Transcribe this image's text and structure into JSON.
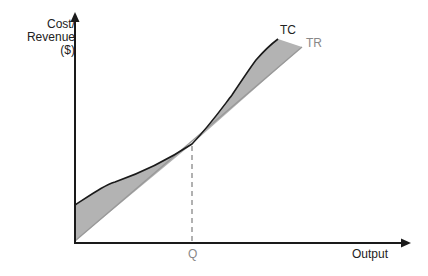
{
  "diagram": {
    "y_axis_label_lines": [
      "Cost/",
      "Revenue",
      "($)"
    ],
    "x_axis_label": "Output",
    "curves": {
      "tc_label": "TC",
      "tr_label": "TR"
    },
    "marker_label": "Q",
    "colors": {
      "axis": "#1a1a1a",
      "tc": "#1a1a1a",
      "tr": "#999999",
      "shade": "#b3b3b3",
      "dashed": "#888888"
    }
  }
}
